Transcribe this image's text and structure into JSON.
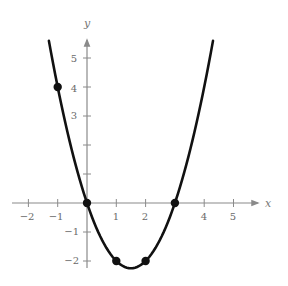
{
  "chart_data": {
    "type": "line",
    "title": "",
    "xlabel": "x",
    "ylabel": "y",
    "function": "y = x^2 - 3x",
    "xlim": [
      -2.5,
      5.8
    ],
    "ylim": [
      -2.4,
      5.9
    ],
    "grid": false,
    "legend": null,
    "x_ticks": [
      -2,
      -1,
      1,
      2,
      4,
      5
    ],
    "y_ticks": [
      -2,
      -1,
      3,
      4,
      5
    ],
    "x_tick_marks": [
      -2,
      -1,
      1,
      2,
      3,
      4,
      5
    ],
    "y_tick_marks": [
      -2,
      -1,
      1,
      2,
      3,
      4,
      5
    ],
    "curve_domain": [
      -1.3,
      4.3
    ],
    "series": [
      {
        "name": "parabola",
        "x": [
          -1.3,
          -1,
          0,
          1,
          1.5,
          2,
          3,
          4,
          4.3
        ],
        "y": [
          5.59,
          4,
          0,
          -2,
          -2.25,
          -2,
          0,
          4,
          5.59
        ]
      }
    ],
    "points": [
      {
        "x": -1,
        "y": 4
      },
      {
        "x": 0,
        "y": 0
      },
      {
        "x": 1,
        "y": -2
      },
      {
        "x": 2,
        "y": -2
      },
      {
        "x": 3,
        "y": 0
      }
    ],
    "colors": {
      "curve": "#111111",
      "axis": "#8a8a8a",
      "labels": "#6a6a6a"
    }
  },
  "labels": {
    "x_axis": "x",
    "y_axis": "y",
    "x_ticks": [
      "−2",
      "−1",
      "1",
      "2",
      "4",
      "5"
    ],
    "y_ticks": [
      "5",
      "4",
      "3",
      "−1",
      "−2"
    ]
  }
}
